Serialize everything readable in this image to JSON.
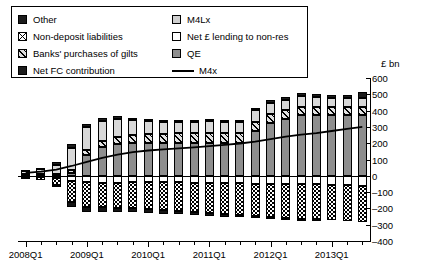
{
  "legend": {
    "left_items": [
      {
        "label": "Other",
        "swatch": "solid-black"
      },
      {
        "label": "Non-deposit liabilities",
        "swatch": "grid-x"
      },
      {
        "label": "Banks' purchases of gilts",
        "swatch": "diag"
      },
      {
        "label": "Net FC contribution",
        "swatch": "solid-black"
      }
    ],
    "right_items": [
      {
        "label": "M4Lx",
        "swatch": "ltgray"
      },
      {
        "label": "Net £ lending to non-res",
        "swatch": "white"
      },
      {
        "label": "QE",
        "swatch": "midgray"
      },
      {
        "label": "M4x",
        "swatch": "line"
      }
    ]
  },
  "chart_data": {
    "type": "bar",
    "title": "",
    "xlabel": "",
    "ylabel": "£ bn",
    "ylim": [
      -400,
      600
    ],
    "yticks": [
      600,
      500,
      400,
      300,
      200,
      100,
      0,
      -100,
      -200,
      -300,
      -400
    ],
    "ytick_labels": [
      "600",
      "500",
      "400",
      "300",
      "200",
      "100",
      "0",
      "–100",
      "–200",
      "–300",
      "–400"
    ],
    "grid": false,
    "legend_position": "top-left",
    "stacked": true,
    "categories": [
      "2008Q1",
      "2008Q2",
      "2008Q3",
      "2008Q4",
      "2009Q1",
      "2009Q2",
      "2009Q3",
      "2009Q4",
      "2010Q1",
      "2010Q2",
      "2010Q3",
      "2010Q4",
      "2011Q1",
      "2011Q2",
      "2011Q3",
      "2011Q4",
      "2012Q1",
      "2012Q2",
      "2012Q3",
      "2012Q4",
      "2013Q1",
      "2013Q2",
      "2013Q3"
    ],
    "major_tick_labels": [
      "2008Q1",
      "2009Q1",
      "2010Q1",
      "2011Q1",
      "2012Q1",
      "2013Q1"
    ],
    "major_tick_indices": [
      0,
      4,
      8,
      12,
      16,
      20
    ],
    "series": [
      {
        "name": "QE",
        "key": "qe",
        "sign": "positive",
        "swatch": "midgray",
        "values": [
          0,
          0,
          0,
          18,
          130,
          175,
          195,
          200,
          200,
          200,
          200,
          200,
          200,
          200,
          200,
          275,
          325,
          350,
          375,
          375,
          375,
          375,
          375
        ]
      },
      {
        "name": "Banks' purchases of gilts",
        "key": "gilts",
        "sign": "positive",
        "swatch": "diag",
        "values": [
          10,
          12,
          14,
          20,
          30,
          38,
          45,
          50,
          55,
          58,
          60,
          62,
          62,
          60,
          60,
          58,
          55,
          52,
          50,
          48,
          45,
          45,
          45
        ]
      },
      {
        "name": "M4Lx",
        "key": "m4lx",
        "sign": "positive",
        "swatch": "ltgray",
        "values": [
          20,
          28,
          55,
          135,
          140,
          125,
          110,
          95,
          80,
          70,
          68,
          70,
          72,
          70,
          70,
          68,
          66,
          64,
          62,
          60,
          58,
          56,
          55
        ]
      },
      {
        "name": "Other",
        "key": "other",
        "sign": "positive",
        "swatch": "solid-black",
        "values": [
          5,
          6,
          18,
          25,
          18,
          15,
          14,
          12,
          12,
          12,
          12,
          12,
          12,
          12,
          12,
          14,
          16,
          16,
          18,
          18,
          20,
          20,
          42
        ]
      },
      {
        "name": "Net £ lending to non-res",
        "key": "nonres",
        "sign": "negative",
        "swatch": "white",
        "values": [
          -8,
          -10,
          -15,
          -30,
          -40,
          -42,
          -42,
          -40,
          -40,
          -40,
          -40,
          -42,
          -45,
          -45,
          -45,
          -48,
          -50,
          -50,
          -52,
          -52,
          -55,
          -55,
          -60
        ]
      },
      {
        "name": "Non-deposit liabilities",
        "key": "nondep",
        "sign": "negative",
        "swatch": "grid-x",
        "values": [
          -10,
          -15,
          -40,
          -130,
          -150,
          -150,
          -155,
          -160,
          -165,
          -170,
          -175,
          -180,
          -185,
          -190,
          -195,
          -200,
          -205,
          -210,
          -215,
          -215,
          -218,
          -220,
          -225
        ]
      },
      {
        "name": "Net FC contribution",
        "key": "netfc",
        "sign": "negative",
        "swatch": "solid-black",
        "values": [
          0,
          0,
          -5,
          -30,
          -35,
          -30,
          -28,
          -25,
          -25,
          -25,
          -22,
          -20,
          -18,
          -15,
          -12,
          -10,
          -8,
          -6,
          -5,
          -4,
          -3,
          -2,
          -2
        ]
      }
    ],
    "line_series": {
      "name": "M4x",
      "key": "m4x",
      "color": "#000000",
      "values": [
        18,
        25,
        38,
        60,
        85,
        110,
        130,
        145,
        155,
        162,
        168,
        175,
        182,
        190,
        198,
        210,
        225,
        240,
        252,
        262,
        275,
        288,
        300
      ]
    }
  }
}
